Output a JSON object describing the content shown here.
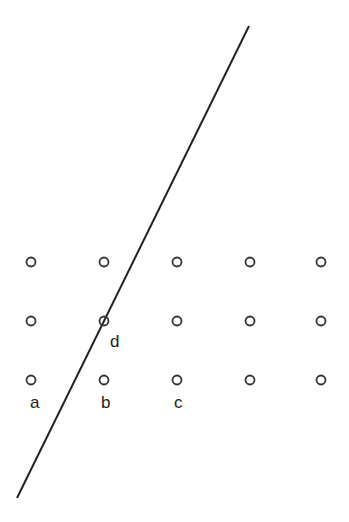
{
  "diagram": {
    "line": {
      "x1": 249,
      "y1": 26,
      "x2": 17,
      "y2": 498,
      "color": "#222222"
    },
    "grid": {
      "columns_x": [
        31,
        104,
        177,
        250,
        321
      ],
      "rows_y": [
        262,
        321,
        380
      ],
      "radius": 4.5,
      "stroke": "#333333"
    },
    "labels": [
      {
        "id": "a",
        "text": "a",
        "x": 30,
        "y": 394
      },
      {
        "id": "b",
        "text": "b",
        "x": 101,
        "y": 394
      },
      {
        "id": "c",
        "text": "c",
        "x": 174,
        "y": 394
      },
      {
        "id": "d",
        "text": "d",
        "x": 110,
        "y": 333
      }
    ]
  }
}
